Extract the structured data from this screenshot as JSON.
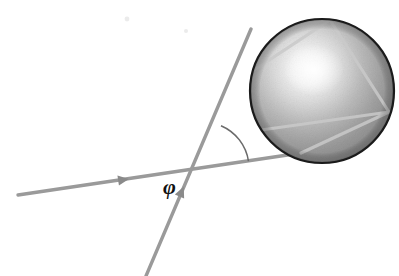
{
  "figure": {
    "background_color": "#ffffff",
    "width": 399,
    "height": 276,
    "labels": {
      "angle_symbol": "φ",
      "angle_symbol_x": 163,
      "angle_symbol_y": 176
    },
    "colors": {
      "ray_gray": "#9a9a9a",
      "ray_gray_dark": "#8a8a8a",
      "internal_ray": "#c9c9c9",
      "sphere_outline": "#1a1a1a",
      "sphere_light": "#f2f2f2",
      "sphere_mid": "#a8a8a8",
      "sphere_dark": "#6e6e6e",
      "angle_arc": "#6b6b6b",
      "label_color": "#111111"
    },
    "sphere": {
      "center_x": 322,
      "center_y": 91,
      "radius": 72,
      "highlight_x": 314,
      "highlight_y": 70,
      "outline_width": 2.2
    },
    "incident_ray": {
      "x1": 18,
      "y1": 195,
      "x2": 301,
      "y2": 153,
      "stroke_width": 3.4,
      "arrow_x": 122,
      "arrow_y": 180,
      "arrow_size": 7
    },
    "secondary_ray": {
      "x1": 146,
      "y1": 276,
      "x2": 251,
      "y2": 29,
      "stroke_width": 3.4,
      "arrow_x": 181,
      "arrow_y": 193,
      "arrow_size": 7
    },
    "internal_rays": [
      {
        "name": "entry-to-top",
        "x1": 251,
        "y1": 29,
        "x2": 330,
        "y2": 20
      },
      {
        "name": "top-to-right",
        "x1": 330,
        "y1": 20,
        "x2": 389,
        "y2": 112
      },
      {
        "name": "right-to-lower-left",
        "x1": 389,
        "y1": 112,
        "x2": 301,
        "y2": 153
      },
      {
        "name": "chord-left-lower",
        "x1": 251,
        "y1": 72,
        "x2": 330,
        "y2": 20
      },
      {
        "name": "chord-lower-band",
        "x1": 261,
        "y1": 130,
        "x2": 389,
        "y2": 112
      }
    ],
    "angle_arc": {
      "vertex_x": 203,
      "vertex_y": 168,
      "radius": 46,
      "stroke_width": 1.6
    },
    "scan_artifacts": [
      {
        "x": 127,
        "y": 19,
        "r": 2.4
      },
      {
        "x": 186,
        "y": 31,
        "r": 2.0
      }
    ]
  }
}
